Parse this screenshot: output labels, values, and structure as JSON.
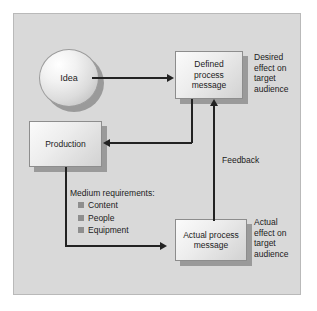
{
  "diagram": {
    "nodes": {
      "idea": "Idea",
      "defined_process_message": "Defined\nprocess\nmessage",
      "production": "Production",
      "actual_process_message": "Actual process\nmessage"
    },
    "annotations": {
      "desired_effect": "Desired\neffect on\ntarget\naudience",
      "actual_effect": "Actual\neffect on\ntarget\naudience"
    },
    "edge_labels": {
      "feedback": "Feedback"
    },
    "requirements": {
      "title": "Medium requirements:",
      "items": [
        "Content",
        "People",
        "Equipment"
      ]
    },
    "colors": {
      "panel_background": "#d9d9d9",
      "node_fill_light": "#fbfbfb",
      "node_fill_dark": "#d2d2d2",
      "shadow": "#9a9a9a",
      "line": "#222222",
      "bullet": "#8e8e8e",
      "text": "#1c1c1c"
    }
  }
}
